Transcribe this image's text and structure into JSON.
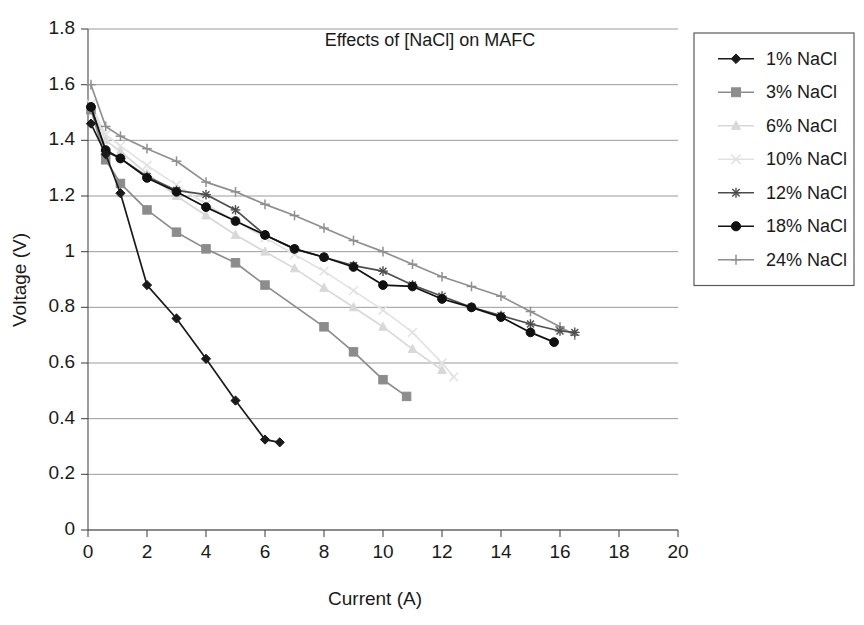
{
  "chart_data": {
    "type": "line",
    "title": "Effects of [NaCl] on MAFC",
    "xlabel": "Current (A)",
    "ylabel": "Voltage (V)",
    "xlim": [
      0,
      20
    ],
    "ylim": [
      0,
      1.8
    ],
    "xticks": [
      "0",
      "2",
      "4",
      "6",
      "8",
      "10",
      "12",
      "14",
      "16",
      "18",
      "20"
    ],
    "yticks": [
      "0",
      "0.2",
      "0.4",
      "0.6",
      "0.8",
      "1",
      "1.2",
      "1.4",
      "1.6",
      "1.8"
    ],
    "xtick_values": [
      0,
      2,
      4,
      6,
      8,
      10,
      12,
      14,
      16,
      18,
      20
    ],
    "ytick_values": [
      0,
      0.2,
      0.4,
      0.6,
      0.8,
      1.0,
      1.2,
      1.4,
      1.6,
      1.8
    ],
    "grid": "horizontal",
    "legend_position": "top-right",
    "series": [
      {
        "name": "1% NaCl",
        "marker": "diamond",
        "color": "#1a1a1a",
        "x": [
          0.1,
          0.6,
          1.1,
          2.0,
          3.0,
          4.0,
          5.0,
          6.0,
          6.5
        ],
        "y": [
          1.46,
          1.35,
          1.21,
          0.88,
          0.76,
          0.615,
          0.465,
          0.325,
          0.315
        ]
      },
      {
        "name": "3% NaCl",
        "marker": "square",
        "color": "#8c8c8c",
        "x": [
          0.1,
          0.6,
          1.1,
          2.0,
          3.0,
          4.0,
          5.0,
          6.0,
          8.0,
          9.0,
          10.0,
          10.8
        ],
        "y": [
          1.51,
          1.33,
          1.245,
          1.15,
          1.07,
          1.01,
          0.96,
          0.88,
          0.73,
          0.64,
          0.54,
          0.48
        ]
      },
      {
        "name": "6% NaCl",
        "marker": "triangle",
        "color": "#d8d8d8",
        "x": [
          0.1,
          0.6,
          1.1,
          2.0,
          3.0,
          4.0,
          5.0,
          6.0,
          7.0,
          8.0,
          9.0,
          10.0,
          11.0,
          12.0
        ],
        "y": [
          1.52,
          1.4,
          1.36,
          1.28,
          1.2,
          1.13,
          1.06,
          1.0,
          0.94,
          0.87,
          0.8,
          0.73,
          0.65,
          0.575
        ]
      },
      {
        "name": "10% NaCl",
        "marker": "x",
        "color": "#e2e2e2",
        "x": [
          0.1,
          0.6,
          1.1,
          2.0,
          3.0,
          4.0,
          5.0,
          6.0,
          7.0,
          8.0,
          9.0,
          10.0,
          11.0,
          12.0,
          12.4
        ],
        "y": [
          1.53,
          1.42,
          1.38,
          1.31,
          1.24,
          1.17,
          1.11,
          1.05,
          0.99,
          0.93,
          0.86,
          0.79,
          0.71,
          0.6,
          0.55
        ]
      },
      {
        "name": "12% NaCl",
        "marker": "asterisk",
        "color": "#4d4d4d",
        "x": [
          0.1,
          0.6,
          1.1,
          2.0,
          3.0,
          4.0,
          5.0,
          6.0,
          7.0,
          8.0,
          9.0,
          10.0,
          11.0,
          12.0,
          13.0,
          14.0,
          15.0,
          16.0,
          16.5
        ],
        "y": [
          1.52,
          1.36,
          1.335,
          1.27,
          1.22,
          1.205,
          1.15,
          1.06,
          1.01,
          0.98,
          0.95,
          0.93,
          0.88,
          0.84,
          0.8,
          0.77,
          0.74,
          0.715,
          0.71
        ]
      },
      {
        "name": "18% NaCl",
        "marker": "circle",
        "color": "#111111",
        "x": [
          0.1,
          0.6,
          1.1,
          2.0,
          3.0,
          4.0,
          5.0,
          6.0,
          7.0,
          8.0,
          9.0,
          10.0,
          11.0,
          12.0,
          13.0,
          14.0,
          15.0,
          15.8
        ],
        "y": [
          1.52,
          1.365,
          1.335,
          1.265,
          1.215,
          1.16,
          1.11,
          1.06,
          1.01,
          0.98,
          0.945,
          0.88,
          0.875,
          0.83,
          0.8,
          0.765,
          0.71,
          0.675
        ]
      },
      {
        "name": "24% NaCl",
        "marker": "plus",
        "color": "#8f8f8f",
        "x": [
          0.1,
          0.6,
          1.1,
          2.0,
          3.0,
          4.0,
          5.0,
          6.0,
          7.0,
          8.0,
          9.0,
          10.0,
          11.0,
          12.0,
          13.0,
          14.0,
          15.0,
          16.0,
          16.5
        ],
        "y": [
          1.6,
          1.45,
          1.415,
          1.37,
          1.325,
          1.25,
          1.215,
          1.17,
          1.13,
          1.085,
          1.04,
          1.0,
          0.955,
          0.91,
          0.875,
          0.84,
          0.785,
          0.73,
          0.7
        ]
      }
    ]
  },
  "legend": {
    "items": [
      {
        "label": "1% NaCl"
      },
      {
        "label": "3% NaCl"
      },
      {
        "label": "6% NaCl"
      },
      {
        "label": "10% NaCl"
      },
      {
        "label": "12% NaCl"
      },
      {
        "label": "18% NaCl"
      },
      {
        "label": "24% NaCl"
      }
    ]
  }
}
